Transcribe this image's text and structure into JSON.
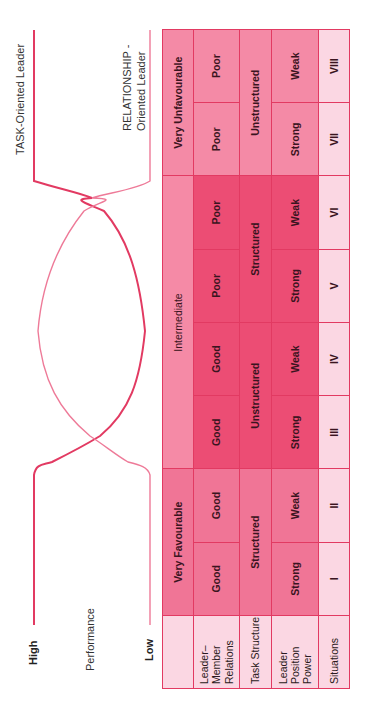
{
  "axis": {
    "high": "High",
    "performance": "Performance",
    "low": "Low"
  },
  "curves": {
    "task_label": "TASK-Oriented Leader",
    "relationship_label_line1": "RELATIONSHIP -",
    "relationship_label_line2": "Oriented Leader",
    "color": "#e23a62"
  },
  "table": {
    "row_labels": {
      "favourability": "",
      "leader_member_relations": "Leader–Member Relations",
      "task_structure": "Task Structure",
      "leader_position_power": "Leader Position Power",
      "situations": "Situations"
    },
    "favourability": [
      {
        "label": "Very Favourable",
        "span": 2
      },
      {
        "label": "Intermediate",
        "span": 4
      },
      {
        "label": "Very Unfavourable",
        "span": 2
      }
    ],
    "leader_member_relations": [
      "Good",
      "Good",
      "Good",
      "Good",
      "Poor",
      "Poor",
      "Poor",
      "Poor"
    ],
    "task_structure": [
      {
        "label": "Structured",
        "span": 2
      },
      {
        "label": "Unstructured",
        "span": 2
      },
      {
        "label": "Structured",
        "span": 2
      },
      {
        "label": "Unstructured",
        "span": 2
      }
    ],
    "leader_position_power": [
      "Strong",
      "Weak",
      "Strong",
      "Weak",
      "Strong",
      "Weak",
      "Strong",
      "Weak"
    ],
    "situations": [
      "I",
      "II",
      "III",
      "IV",
      "V",
      "VI",
      "VII",
      "VIII"
    ]
  },
  "colors": {
    "border": "#e23a62",
    "light_cell": "#f48aa6",
    "dark_cell": "#ec4d74",
    "pale_cell": "#fbd7e3"
  }
}
